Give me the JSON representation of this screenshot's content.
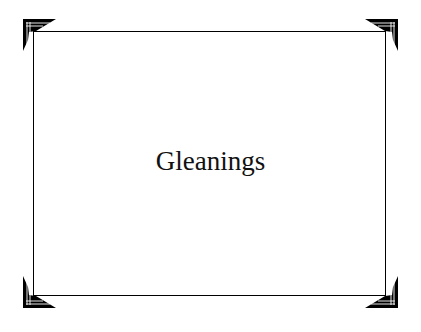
{
  "title": "Gleanings",
  "colors": {
    "background": "#ffffff",
    "frame": "#000000",
    "text": "#111111"
  },
  "decor": {
    "corners": [
      "top-left-bracket-icon",
      "top-right-bracket-icon",
      "bottom-left-bracket-icon",
      "bottom-right-bracket-icon"
    ]
  }
}
